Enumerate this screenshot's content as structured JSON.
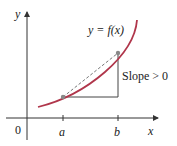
{
  "diagram": {
    "y_axis_label": "y",
    "x_axis_label": "x",
    "origin_label": "0",
    "point_a_label": "a",
    "point_b_label": "b",
    "curve_label": "y = f(x)",
    "slope_label": "Slope > 0",
    "colors": {
      "curve": "#b0364b",
      "axes": "#333333",
      "secant": "#777777",
      "triangle": "#444444",
      "points": "#888888"
    }
  }
}
